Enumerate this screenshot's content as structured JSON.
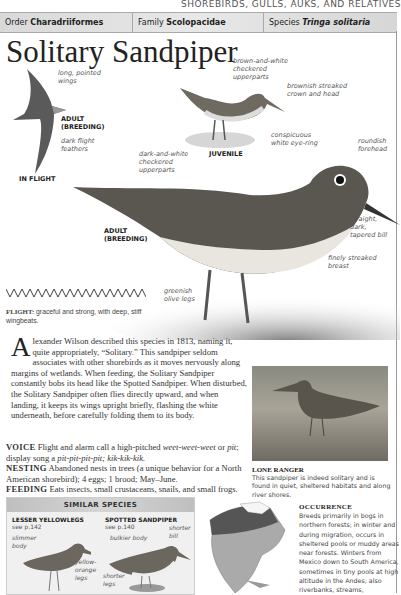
{
  "section_header": "SHOREBIRDS, GULLS, AUKS, AND RELATIVES",
  "taxonomy": {
    "order_label": "Order",
    "order_value": "Charadriiformes",
    "family_label": "Family",
    "family_value": "Scolopacidae",
    "species_label": "Species",
    "species_value": "Tringa solitaria"
  },
  "title": "Solitary Sandpiper",
  "illustrations": {
    "flight": {
      "labels": [
        "long, pointed wings",
        "ADULT (BREEDING)",
        "dark flight feathers"
      ],
      "caption": "IN FLIGHT",
      "label_wings_1": "long, pointed",
      "label_wings_2": "wings",
      "label_adult_1": "ADULT",
      "label_adult_2": "(BREEDING)",
      "label_feathers_1": "dark flight",
      "label_feathers_2": "feathers"
    },
    "juvenile": {
      "caption": "JUVENILE",
      "label_upper_1": "brown-and-white",
      "label_upper_2": "checkered",
      "label_upper_3": "upperparts",
      "label_head_1": "brownish streaked",
      "label_head_2": "crown and head"
    },
    "adult": {
      "caption_1": "ADULT",
      "caption_2": "(BREEDING)",
      "label_eye_1": "conspicuous",
      "label_eye_2": "white eye-ring",
      "label_forehead_1": "roundish",
      "label_forehead_2": "forehead",
      "label_upper_1": "dark-and-white",
      "label_upper_2": "checkered",
      "label_upper_3": "upperparts",
      "label_bill_1": "straight,",
      "label_bill_2": "dark,",
      "label_bill_3": "tapered bill",
      "label_breast_1": "finely streaked",
      "label_breast_2": "breast",
      "label_legs_1": "greenish",
      "label_legs_2": "olive legs"
    }
  },
  "flight_pattern": {
    "label": "FLIGHT:",
    "text": "graceful and strong, with deep, stiff wingbeats."
  },
  "description": {
    "dropcap": "A",
    "text": "lexander Wilson described this species in 1813, naming it, quite appropriately, “Solitary.” This sandpiper seldom associates with other shorebirds as it moves nervously along margins of wetlands. When feeding, the Solitary Sandpiper constantly bobs its head like the Spotted Sandpiper. When disturbed, the Solitary Sandpiper often flies directly upward, and when landing, it keeps its wings upright briefly, flashing the white underneath, before carefully folding them to its body."
  },
  "facts": {
    "voice_label": "VOICE",
    "voice_text_1": "Flight and alarm call a high-pitched ",
    "voice_italic_1": "weet-weet-weet",
    "voice_text_2": " or ",
    "voice_italic_2": "pit",
    "voice_text_3": "; display song a ",
    "voice_italic_3": "pit-pit-pit-pit; kik-kik-kik.",
    "nesting_label": "NESTING",
    "nesting_text": "Abandoned nests in trees (a unique behavior for a North American shorebird); 4 eggs; 1 brood; May–June.",
    "feeding_label": "FEEDING",
    "feeding_text": "Eats insects, small crustaceans, snails, and small frogs."
  },
  "photo": {
    "caption_title": "LONE RANGER",
    "caption_text": "This sandpiper is indeed solitary and is found in quiet, sheltered habitats and along river shores."
  },
  "similar_species": {
    "heading": "SIMILAR SPECIES",
    "items": [
      {
        "name": "LESSER YELLOWLEGS",
        "ref": "see p.142",
        "labels": [
          "slimmer body",
          "yellow-orange legs"
        ]
      },
      {
        "name": "SPOTTED SANDPIPER",
        "ref": "see p.140",
        "labels": [
          "bulkier body",
          "shorter bill",
          "shorter legs"
        ]
      }
    ]
  },
  "occurrence": {
    "title": "OCCURRENCE",
    "text": "Breeds primarily in bogs in northern forests; in winter and during migration, occurs in sheltered pools or muddy areas near forests. Winters from Mexico down to South America, sometimes in tiny pools at high altitude in the Andes; also riverbanks, streams,"
  },
  "colors": {
    "header_bar": "#dcdcdc",
    "text": "#222222",
    "label": "#555555"
  }
}
